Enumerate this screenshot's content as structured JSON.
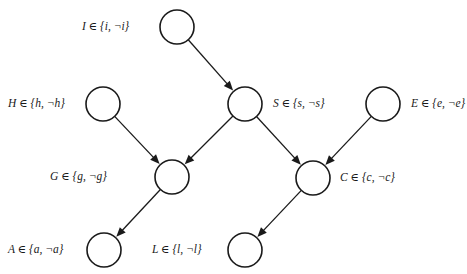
{
  "diagram": {
    "type": "bayesian-network",
    "title": "",
    "canvas": {
      "width": 467,
      "height": 274,
      "background": "#ffffff"
    },
    "style": {
      "node_fill": "#ffffff",
      "node_stroke": "#1a1a1a",
      "edge_color": "#1a1a1a",
      "node_radius": 17,
      "text_color": "#1a1a1a"
    },
    "nodes": [
      {
        "id": "I",
        "label": "I ∈ {i, ¬i}",
        "cx": 177,
        "cy": 27,
        "label_side": "left",
        "label_x": 82,
        "label_y": 21
      },
      {
        "id": "H",
        "label": "H ∈ {h, ¬h}",
        "cx": 103,
        "cy": 104,
        "label_side": "left",
        "label_x": 8,
        "label_y": 98
      },
      {
        "id": "S",
        "label": "S ∈ {s, ¬s}",
        "cx": 245,
        "cy": 104,
        "label_side": "right",
        "label_x": 273,
        "label_y": 98
      },
      {
        "id": "E",
        "label": "E ∈ {e, ¬e}",
        "cx": 383,
        "cy": 104,
        "label_side": "right",
        "label_x": 411,
        "label_y": 98
      },
      {
        "id": "G",
        "label": "G ∈ {g, ¬g}",
        "cx": 172,
        "cy": 177,
        "label_side": "left",
        "label_x": 50,
        "label_y": 171
      },
      {
        "id": "C",
        "label": "C ∈ {c, ¬c}",
        "cx": 313,
        "cy": 178,
        "label_side": "right",
        "label_x": 340,
        "label_y": 172
      },
      {
        "id": "A",
        "label": "A ∈ {a, ¬a}",
        "cx": 104,
        "cy": 250,
        "label_side": "left",
        "label_x": 8,
        "label_y": 244
      },
      {
        "id": "L",
        "label": "L ∈ {l, ¬l}",
        "cx": 245,
        "cy": 250,
        "label_side": "left",
        "label_x": 152,
        "label_y": 244
      }
    ],
    "edges": [
      {
        "id": "I-S",
        "from": "I",
        "to": "S",
        "directed": true
      },
      {
        "id": "H-G",
        "from": "H",
        "to": "G",
        "directed": true
      },
      {
        "id": "S-G",
        "from": "S",
        "to": "G",
        "directed": true
      },
      {
        "id": "S-C",
        "from": "S",
        "to": "C",
        "directed": true
      },
      {
        "id": "E-C",
        "from": "E",
        "to": "C",
        "directed": true
      },
      {
        "id": "G-A",
        "from": "G",
        "to": "A",
        "directed": true
      },
      {
        "id": "C-L",
        "from": "C",
        "to": "L",
        "directed": true
      }
    ]
  }
}
